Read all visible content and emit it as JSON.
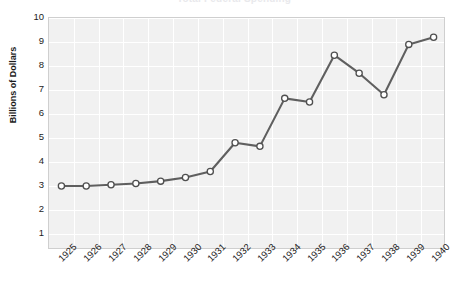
{
  "chart_data": {
    "type": "line",
    "title": "Total Federal Spending",
    "xlabel": "",
    "ylabel": "Billions of Dollars",
    "ylim": [
      0.33,
      10
    ],
    "yticks": [
      10,
      9,
      8,
      7,
      6,
      5,
      4,
      3,
      2,
      1
    ],
    "grid": true,
    "legend_position": "none",
    "categories": [
      "1925",
      "1926",
      "1927",
      "1928",
      "1929",
      "1930",
      "1931",
      "1932",
      "1933",
      "1934",
      "1935",
      "1936",
      "1937",
      "1938",
      "1939",
      "1940"
    ],
    "values": [
      3.0,
      3.0,
      3.05,
      3.1,
      3.2,
      3.35,
      3.6,
      4.8,
      4.65,
      6.65,
      6.5,
      8.45,
      7.7,
      6.8,
      8.9,
      9.2
    ],
    "series": [
      {
        "name": "Billions of Dollars",
        "values": [
          3.0,
          3.0,
          3.05,
          3.1,
          3.2,
          3.35,
          3.6,
          4.8,
          4.65,
          6.65,
          6.5,
          8.45,
          7.7,
          6.8,
          8.9,
          9.2
        ]
      }
    ],
    "colors": {
      "line": "#5f5f5f",
      "marker_fill": "#ffffff",
      "marker_edge": "#4f4f4f",
      "plot_background": "#f1f1f1",
      "gridline": "#ffffff",
      "plot_border": "#cfcfcf",
      "text": "#1c1c1c",
      "page_background": "#ffffff"
    },
    "marker": "circle",
    "xtick_rotation": -45
  }
}
